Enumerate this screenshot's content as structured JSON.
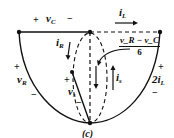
{
  "figure": {
    "caption": "(c)",
    "labels": {
      "vC": {
        "sym": "v",
        "sub": "C",
        "plus": "+",
        "minus": "−"
      },
      "iL": {
        "sym": "i",
        "sub": "L"
      },
      "iR": {
        "sym": "i",
        "sub": "R"
      },
      "is": {
        "sym": "i",
        "sub": "s"
      },
      "vR": {
        "sym": "v",
        "sub": "R",
        "plus": "+",
        "minus": "−"
      },
      "vs": {
        "sym": "v",
        "sub": "s",
        "plus": "+",
        "minus": "−"
      },
      "dep": {
        "sym": "2i",
        "sub": "L",
        "plus": "+",
        "minus": "−"
      },
      "fraction": {
        "numerator": "v_R − v_C",
        "denominator": "6"
      }
    },
    "colors": {
      "line": "#111111",
      "background": "#ffffff"
    }
  }
}
